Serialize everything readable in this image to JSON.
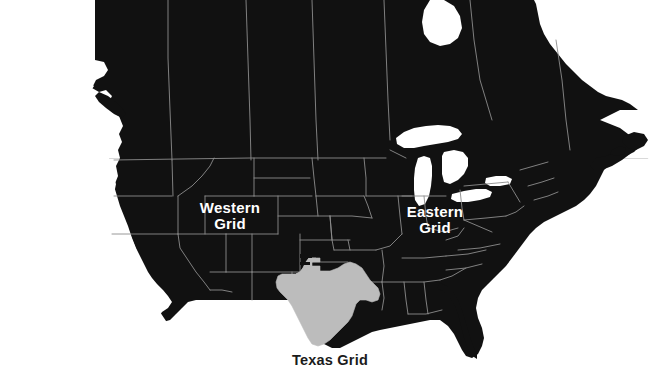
{
  "figure": {
    "kind": "map",
    "region": "North America",
    "background_color": "#ffffff"
  },
  "colors": {
    "land_fill": "#111111",
    "land_fill_alt": "#0d0d0d",
    "border_stroke": "#8c8c8c",
    "lakes_fill": "#ffffff",
    "texas_fill": "#bcbcbc",
    "texas_stroke": "#bcbcbc",
    "label_light": "#ffffff",
    "label_dark": "#1b1b1b",
    "rule_color": "#d9d9d9"
  },
  "labels": {
    "western": "Western\nGrid",
    "eastern": "Eastern\nGrid",
    "texas": "Texas Grid"
  },
  "regions": [
    {
      "id": "western-grid",
      "name": "Western Grid",
      "fill": "#111111",
      "label_color": "#ffffff"
    },
    {
      "id": "eastern-grid",
      "name": "Eastern Grid",
      "fill": "#111111",
      "label_color": "#ffffff"
    },
    {
      "id": "texas-grid",
      "name": "Texas Grid",
      "fill": "#bcbcbc",
      "label_color": "#1b1b1b"
    }
  ],
  "features": {
    "great_lakes": "Great Lakes",
    "horizontal_rule": "background-rule"
  }
}
